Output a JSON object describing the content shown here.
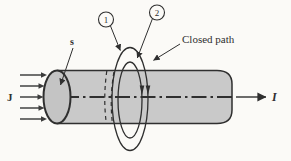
{
  "figure": {
    "labels": {
      "current_density": "J",
      "surface": "s",
      "path1": "1",
      "path2": "2",
      "closed_path": "Closed path",
      "current": "I"
    }
  },
  "colors": {
    "background": "#fbfaf7",
    "line": "#2f2f2f",
    "cylinder_fill": "#c9c9c9",
    "cylinder_face_fill": "#c4c4c4",
    "arrow_shaft": "#575757",
    "arrow_head": "#3c3c3c"
  }
}
